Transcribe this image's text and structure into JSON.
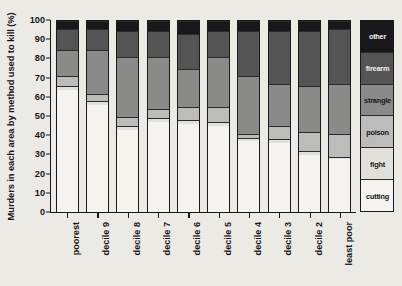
{
  "chart_data": {
    "type": "bar",
    "subtype": "stacked-bar-100",
    "title": "",
    "ylabel": "Murders in each area by method used to kill (%)",
    "xlabel": "",
    "ylim": [
      0,
      100
    ],
    "yticks": [
      0,
      10,
      20,
      30,
      40,
      50,
      60,
      70,
      80,
      90,
      100
    ],
    "ytick_labels": [
      "0",
      "10",
      "20",
      "30",
      "40",
      "50",
      "60",
      "70",
      "80",
      "90",
      "100"
    ],
    "grid": false,
    "legend_position": "right",
    "categories": [
      "poorest",
      "decile 9",
      "decile 8",
      "decile 7",
      "decile 6",
      "decile 5",
      "decile 4",
      "decile 3",
      "decile 2",
      "least poor"
    ],
    "series": [
      {
        "name": "cutting",
        "color": "#f4f3ef",
        "values": [
          64,
          56,
          43,
          47,
          46,
          45,
          37,
          36,
          30,
          28
        ]
      },
      {
        "name": "fight",
        "color": "#e2e0da",
        "values": [
          2,
          2,
          2,
          2,
          2,
          2,
          2,
          2,
          2,
          1
        ]
      },
      {
        "name": "poison",
        "color": "#bcbcba",
        "values": [
          5,
          4,
          5,
          5,
          7,
          8,
          2,
          7,
          10,
          12
        ]
      },
      {
        "name": "strangle",
        "color": "#8a8a88",
        "values": [
          14,
          23,
          31,
          27,
          20,
          26,
          30,
          22,
          24,
          26
        ]
      },
      {
        "name": "firearm",
        "color": "#545454",
        "values": [
          11,
          11,
          14,
          14,
          18,
          14,
          24,
          28,
          29,
          29
        ]
      },
      {
        "name": "other",
        "color": "#18181a",
        "values": [
          4,
          4,
          5,
          5,
          7,
          5,
          5,
          5,
          5,
          4
        ]
      }
    ],
    "legend_entries": [
      {
        "label": "other",
        "color": "#18181a",
        "text_color": "#f2f1ed"
      },
      {
        "label": "firearm",
        "color": "#545454",
        "text_color": "#f2f1ed"
      },
      {
        "label": "strangle",
        "color": "#8a8a88",
        "text_color": "#16161a"
      },
      {
        "label": "poison",
        "color": "#bcbcba",
        "text_color": "#16161a"
      },
      {
        "label": "fight",
        "color": "#e2e0da",
        "text_color": "#16161a"
      },
      {
        "label": "cutting",
        "color": "#f4f3ef",
        "text_color": "#16161a"
      }
    ]
  },
  "colors": {
    "background": "#eceae5",
    "axis": "#16161a",
    "plot_background": "#f3f2ee"
  }
}
